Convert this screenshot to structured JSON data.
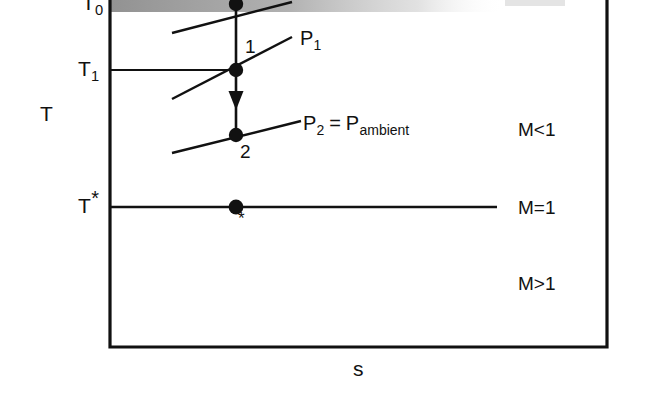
{
  "figure": {
    "kind": "T-s thermodynamic diagram",
    "width": 648,
    "height": 408,
    "background_color": "#ffffff",
    "ink_color": "#111111"
  },
  "axes": {
    "y_label": "T",
    "x_label": "s",
    "left_axis_x": 110,
    "right_axis_x": 607,
    "bottom_axis_y": 347,
    "top_cut_off": true
  },
  "tick_labels": [
    {
      "id": "T0",
      "base": "T",
      "sub": "0",
      "y": 8,
      "clipped": true
    },
    {
      "id": "T1",
      "base": "T",
      "sub": "1",
      "y": 70,
      "clipped": false
    },
    {
      "id": "Tstar",
      "base": "T",
      "star": "*",
      "y": 207,
      "clipped": false
    }
  ],
  "isobars": [
    {
      "id": "P0",
      "label_base": "P",
      "label_sub": "0",
      "label_visible": false,
      "x1": 172,
      "y1": 33,
      "x2": 291,
      "y2": 3
    },
    {
      "id": "P1",
      "label_base": "P",
      "label_sub": "1",
      "label_visible": true,
      "x1": 172,
      "y1": 99,
      "x2": 291,
      "y2": 38,
      "label_x": 300,
      "label_y": 33
    },
    {
      "id": "P2",
      "label_base": "P",
      "label_sub": "2",
      "label_equals": "=",
      "label_second_base": "P",
      "label_second_sub": "ambient",
      "label_visible": true,
      "x1": 172,
      "y1": 153,
      "x2": 300,
      "y2": 122,
      "label_x": 303,
      "label_y": 119
    }
  ],
  "states": [
    {
      "id": "0",
      "label": "",
      "x": 236,
      "y": 4,
      "label_x": 0,
      "label_y": 0,
      "show_label": false
    },
    {
      "id": "1",
      "label": "1",
      "x": 236,
      "y": 70,
      "label_x": 245,
      "label_y": 37,
      "show_label": true
    },
    {
      "id": "2",
      "label": "2",
      "x": 236,
      "y": 135,
      "label_x": 240,
      "label_y": 142,
      "show_label": true
    },
    {
      "id": "star",
      "label": "*",
      "x": 236,
      "y": 207,
      "label_x": 239,
      "label_y": 212,
      "show_label": true
    }
  ],
  "process_arrow": {
    "from_x": 236,
    "from_y": 70,
    "to_x": 236,
    "to_y": 135,
    "head_y": 104,
    "description": "expansion from state 1 to state 2"
  },
  "horizontal_lines": [
    {
      "id": "T1-isotherm",
      "x1": 110,
      "y1": 70,
      "x2": 236,
      "y2": 70
    },
    {
      "id": "Tstar-isotherm",
      "x1": 110,
      "y1": 207,
      "x2": 497,
      "y2": 207
    }
  ],
  "vertical_segments": [
    {
      "id": "state0-to-state1",
      "x1": 236,
      "y1": 4,
      "x2": 236,
      "y2": 70
    }
  ],
  "mach_regions": [
    {
      "id": "subsonic",
      "label": "M<1",
      "x": 518,
      "y": 128
    },
    {
      "id": "sonic",
      "label": "M=1",
      "x": 518,
      "y": 198
    },
    {
      "id": "supersonic",
      "label": "M>1",
      "x": 518,
      "y": 274
    }
  ],
  "axis_var_labels": {
    "T": {
      "text": "T",
      "x": 40,
      "y": 103
    },
    "s": {
      "text": "s",
      "x": 353,
      "y": 358
    }
  },
  "artifact": {
    "type": "scan-shadow-band",
    "x": 110,
    "y": 0,
    "width": 380,
    "height": 12,
    "color": "#9a9a9a"
  }
}
